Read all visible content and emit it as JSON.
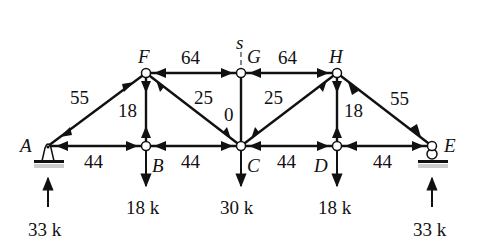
{
  "section_label": "s",
  "nodes": {
    "A": {
      "label": "A",
      "x": 48,
      "y": 146
    },
    "B": {
      "label": "B",
      "x": 146,
      "y": 146
    },
    "C": {
      "label": "C",
      "x": 241,
      "y": 146
    },
    "D": {
      "label": "D",
      "x": 337,
      "y": 146
    },
    "E": {
      "label": "E",
      "x": 432,
      "y": 146
    },
    "F": {
      "label": "F",
      "x": 146,
      "y": 73
    },
    "G": {
      "label": "G",
      "x": 241,
      "y": 73
    },
    "H": {
      "label": "H",
      "x": 337,
      "y": 73
    }
  },
  "members": {
    "AF": "55",
    "FG": "64",
    "GH": "64",
    "HE": "55",
    "FB": "18",
    "FC": "25",
    "GC": "0",
    "CH": "25",
    "HD": "18",
    "AB": "44",
    "BC": "44",
    "CD": "44",
    "DE": "44"
  },
  "loads": {
    "B": "18 k",
    "C": "30 k",
    "D": "18 k"
  },
  "reactions": {
    "A": "33 k",
    "E": "33 k"
  }
}
